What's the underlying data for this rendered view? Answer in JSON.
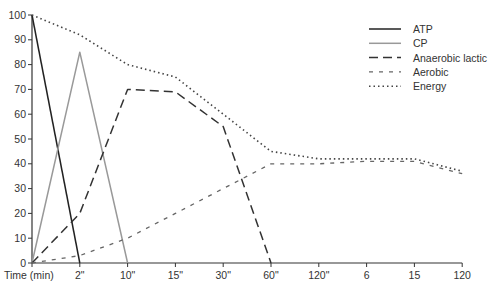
{
  "chart_data": {
    "type": "line",
    "title": "",
    "xlabel": "Time (min)",
    "ylabel": "",
    "ylim": [
      0,
      100
    ],
    "yticks": [
      0,
      10,
      20,
      30,
      40,
      50,
      60,
      70,
      80,
      90,
      100
    ],
    "categories": [
      "Time (min)",
      "2\"",
      "10\"",
      "15\"",
      "30\"",
      "60\"",
      "120\"",
      "6",
      "15",
      "120"
    ],
    "grid": false,
    "legend_position": "top-right",
    "series": [
      {
        "name": "ATP",
        "style": "solid",
        "color": "#222222",
        "points": [
          [
            0,
            100
          ],
          [
            1,
            0
          ]
        ]
      },
      {
        "name": "CP",
        "style": "solid",
        "color": "#999999",
        "points": [
          [
            0,
            0
          ],
          [
            1,
            85
          ],
          [
            2,
            0
          ]
        ]
      },
      {
        "name": "Anaerobic lactic",
        "style": "dashed",
        "color": "#333333",
        "points": [
          [
            0,
            0
          ],
          [
            1,
            20
          ],
          [
            2,
            70
          ],
          [
            3,
            69
          ],
          [
            4,
            55
          ],
          [
            5,
            0
          ]
        ]
      },
      {
        "name": "Aerobic",
        "style": "short-dashed",
        "color": "#666666",
        "points": [
          [
            0,
            0
          ],
          [
            1,
            3
          ],
          [
            2,
            10
          ],
          [
            3,
            20
          ],
          [
            4,
            30
          ],
          [
            5,
            40
          ],
          [
            6,
            40
          ],
          [
            7,
            41
          ],
          [
            8,
            41
          ],
          [
            9,
            36
          ]
        ]
      },
      {
        "name": "Energy",
        "style": "dotted",
        "color": "#444444",
        "points": [
          [
            0,
            100
          ],
          [
            1,
            92
          ],
          [
            2,
            80
          ],
          [
            3,
            75
          ],
          [
            4,
            60
          ],
          [
            5,
            45
          ],
          [
            6,
            42
          ],
          [
            7,
            42
          ],
          [
            8,
            42
          ],
          [
            9,
            37
          ]
        ]
      }
    ]
  },
  "legend": {
    "items": [
      "ATP",
      "CP",
      "Anaerobic lactic",
      "Aerobic",
      "Energy"
    ]
  }
}
